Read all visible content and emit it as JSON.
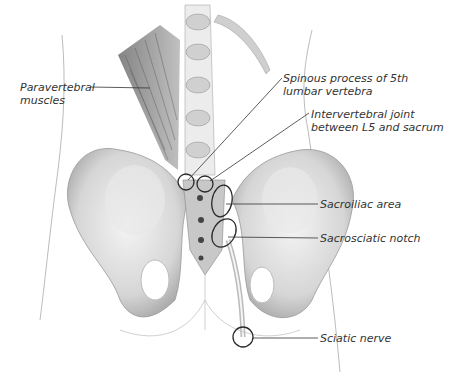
{
  "figure": {
    "labels": [
      {
        "id": "paravertebral",
        "line1": "Paravertebral",
        "line2": "muscles"
      },
      {
        "id": "spinous",
        "line1": "Spinous process of 5th",
        "line2": "lumbar vertebra"
      },
      {
        "id": "intervertebral",
        "line1": "Intervertebral joint",
        "line2": "between L5 and sacrum"
      },
      {
        "id": "sacroiliac",
        "line1": "Sacroiliac area"
      },
      {
        "id": "sacrosciatic",
        "line1": "Sacrosciatic notch"
      },
      {
        "id": "sciatic",
        "line1": "Sciatic nerve"
      }
    ],
    "colors": {
      "ink": "#333333",
      "bone": "#d9d9d9",
      "shade": "#9a9a9a",
      "outline": "#555555"
    }
  }
}
